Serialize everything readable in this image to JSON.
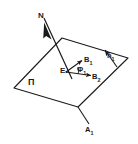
{
  "figure": {
    "background_color": "#ffffff",
    "stroke_color": "#1a1a1a",
    "labels": {
      "normal_axis": "N",
      "plane": "П",
      "origin_point": "E",
      "vector_b1_base": "B",
      "vector_b1_sub": "1",
      "vector_b2_base": "B",
      "vector_b2_sub": "2",
      "angle_phi_base": "Φ",
      "angle_phi_sub": "1",
      "normal_vector_base": "n",
      "normal_vector_sub": "1",
      "point_a1_base": "A",
      "point_a1_sub": "1"
    },
    "geometry": {
      "plane_polygon": "62,38 128,58 78,107 14,88",
      "n_axis_line": {
        "x1": 44,
        "y1": 18,
        "x2": 72,
        "y2": 79
      },
      "n_arrow_tip": {
        "x": 48,
        "y": 27
      },
      "e_point": {
        "x": 66,
        "y": 72
      },
      "b1_vector": {
        "x1": 66,
        "y1": 72,
        "x2": 83,
        "y2": 60
      },
      "b2_vector": {
        "x1": 66,
        "y1": 72,
        "x2": 93,
        "y2": 76
      },
      "normal_vector": {
        "x1": 117,
        "y1": 66,
        "x2": 104,
        "y2": 49
      },
      "a1_line": {
        "x1": 78,
        "y1": 107,
        "x2": 90,
        "y2": 125
      }
    }
  }
}
